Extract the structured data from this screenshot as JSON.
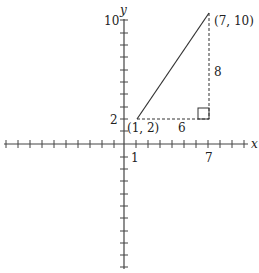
{
  "diagram": {
    "type": "coordinate-plane-right-triangle",
    "axes": {
      "x_label": "x",
      "y_label": "y",
      "x_tick_labels": [
        {
          "value": 1,
          "text": "1"
        },
        {
          "value": 7,
          "text": "7"
        }
      ],
      "y_tick_labels": [
        {
          "value": 2,
          "text": "2"
        },
        {
          "value": 10,
          "text": "10"
        }
      ]
    },
    "points": [
      {
        "label": "(1, 2)",
        "x": 1,
        "y": 2
      },
      {
        "label": "(7, 10)",
        "x": 7,
        "y": 10
      }
    ],
    "legs": {
      "horizontal_label": "6",
      "vertical_label": "8"
    },
    "right_angle_at": {
      "x": 7,
      "y": 2
    },
    "colors": {
      "line": "#333333",
      "background": "#ffffff"
    }
  }
}
